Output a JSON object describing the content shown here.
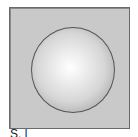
{
  "figure": {
    "shape": "sphere",
    "caption": "S. l"
  },
  "colors": {
    "background_panel": "#c9c9c9",
    "frame_border": "#6a6a6a",
    "sphere_highlight": "#ffffff",
    "sphere_edge": "#8c8c8c"
  }
}
